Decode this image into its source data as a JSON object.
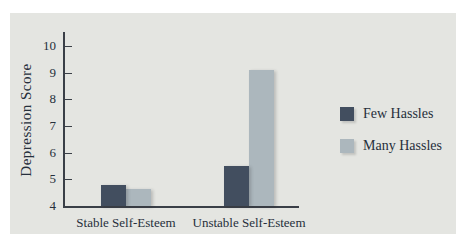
{
  "figure": {
    "background": "#ffffff",
    "panel_background": "#e4e5e1",
    "axis_color": "#3a3f47",
    "text_color": "#262f3b"
  },
  "chart_data": {
    "type": "bar",
    "title": "",
    "categories": [
      "Stable Self-Esteem",
      "Unstable Self-Esteem"
    ],
    "series": [
      {
        "name": "Few Hassles",
        "color": "#424e5f",
        "values": [
          4.8,
          5.5
        ]
      },
      {
        "name": "Many Hassles",
        "color": "#acb7bd",
        "values": [
          4.65,
          9.1
        ]
      }
    ],
    "xlabel": "",
    "ylabel": "Depression Score",
    "ylim": [
      4,
      10.5
    ],
    "yticks": [
      4,
      5,
      6,
      7,
      8,
      9,
      10
    ],
    "grid": false,
    "legend_position": "right"
  }
}
